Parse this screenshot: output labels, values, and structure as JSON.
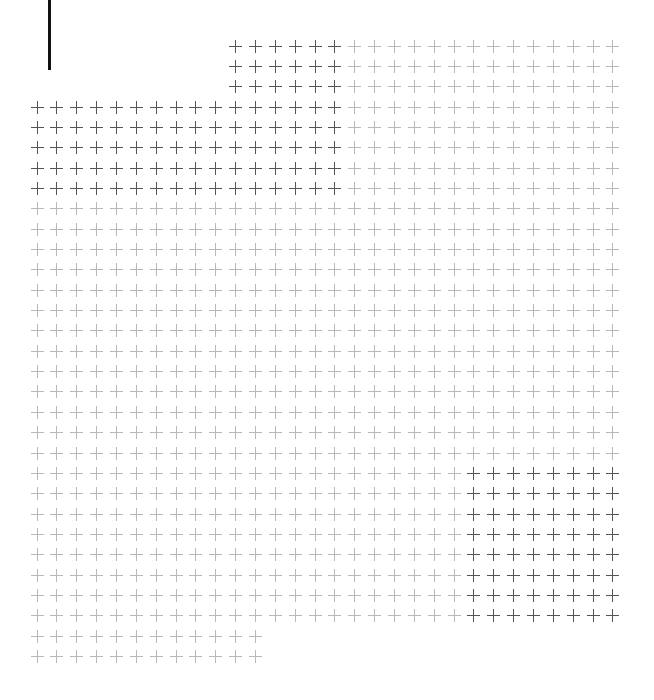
{
  "cursor_bar": {
    "x": 48,
    "y": 0,
    "width": 3,
    "height": 70,
    "color": "#111111"
  },
  "grid": {
    "origin_x": 37,
    "origin_y": 46,
    "col_spacing": 19.86,
    "row_spacing": 20.35,
    "cols": 30,
    "rows": 31,
    "symbol": "+",
    "light_color": "#b8b8b8",
    "dark_color": "#555555",
    "row_ranges": [
      {
        "rows": [
          0,
          2
        ],
        "cols": [
          10,
          29
        ]
      },
      {
        "rows": [
          3,
          28
        ],
        "cols": [
          0,
          29
        ]
      },
      {
        "rows": [
          29,
          30
        ],
        "cols": [
          0,
          11
        ]
      }
    ],
    "dark_regions": [
      {
        "rows": [
          0,
          7
        ],
        "cols": [
          10,
          15
        ]
      },
      {
        "rows": [
          3,
          7
        ],
        "cols": [
          0,
          15
        ]
      },
      {
        "rows": [
          21,
          28
        ],
        "cols": [
          22,
          29
        ]
      }
    ]
  }
}
